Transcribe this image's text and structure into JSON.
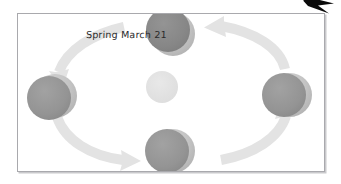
{
  "figure": {
    "background_color": "#ffffff",
    "panel": {
      "border_color": "#a9a9ad",
      "fill_color": "#ffffff",
      "shadow_color": "#c9c9cc"
    }
  },
  "corner_marker": {
    "name": "black-arrow-marker",
    "color": "#0a0a0a",
    "direction": "right"
  },
  "labels": [
    {
      "id": "spring-label",
      "text": "Spring March 21",
      "color": "#2b2b2b"
    }
  ],
  "sun": {
    "name": "sun",
    "cx": 144,
    "cy": 73,
    "r": 16,
    "color": "#e0e0e0"
  },
  "earths": [
    {
      "id": "earth-top",
      "position": "top",
      "cx": 155,
      "cy": 20,
      "r": 22,
      "lit_color": "#b4b4b4",
      "dark_color": "#8c8c8c",
      "shadow_offset_x": -5,
      "shadow_offset_y": -4
    },
    {
      "id": "earth-left",
      "position": "left",
      "cx": 37,
      "cy": 82,
      "r": 22,
      "lit_color": "#bdbdbd",
      "dark_color": "#9a9a9a",
      "shadow_offset_x": -6,
      "shadow_offset_y": 2
    },
    {
      "id": "earth-right",
      "position": "right",
      "cx": 272,
      "cy": 81,
      "r": 22,
      "lit_color": "#c6c6c6",
      "dark_color": "#a8a8a8",
      "shadow_offset_x": -6,
      "shadow_offset_y": 0
    },
    {
      "id": "earth-bottom",
      "position": "bottom",
      "cx": 155,
      "cy": 137,
      "r": 22,
      "lit_color": "#c2c2c2",
      "dark_color": "#a2a2a2",
      "shadow_offset_x": -6,
      "shadow_offset_y": 0
    }
  ],
  "orbit_arrows": [
    {
      "id": "arrow-top-right",
      "from": "right",
      "to": "top",
      "direction": "left",
      "color": "#e3e3e3"
    },
    {
      "id": "arrow-top-left",
      "from": "top",
      "to": "left",
      "direction": "down-left",
      "color": "#e3e3e3"
    },
    {
      "id": "arrow-bottom-left",
      "from": "left",
      "to": "bottom",
      "direction": "right",
      "color": "#e3e3e3"
    },
    {
      "id": "arrow-bottom-right",
      "from": "bottom",
      "to": "right",
      "direction": "up-right",
      "color": "#e3e3e3"
    }
  ]
}
